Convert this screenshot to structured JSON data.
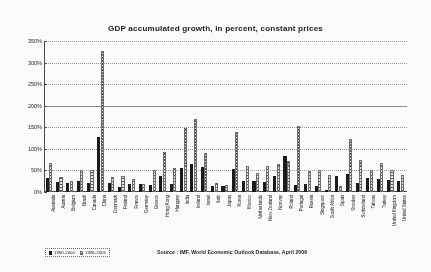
{
  "chart_data": {
    "type": "bar",
    "title": "GDP accumulated growth, in percent, constant prices",
    "xlabel": "",
    "ylabel": "",
    "ylim": [
      0,
      350
    ],
    "ytick_labels": [
      "350%",
      "300%",
      "250%",
      "200%",
      "150%",
      "100%",
      "50%",
      "0%"
    ],
    "ytick_values": [
      350,
      300,
      250,
      200,
      150,
      100,
      50,
      0
    ],
    "grid": true,
    "legend_position": "bottom-left",
    "categories": [
      "Australia",
      "Austria",
      "Belgium",
      "Brazil",
      "Canada",
      "China",
      "Denmark",
      "Finland",
      "France",
      "Germany",
      "Greece",
      "Hong Kong",
      "Hungary",
      "India",
      "Ireland",
      "Israel",
      "Italy",
      "Japan",
      "Korea",
      "Mexico",
      "Netherlands",
      "New Zealand",
      "Norway",
      "Poland",
      "Portugal",
      "Russia",
      "Singapore",
      "South Africa",
      "Spain",
      "Sweden",
      "Switzerland",
      "Taiwan",
      "Turkey",
      "United Kingdom",
      "United States"
    ],
    "series": [
      {
        "name": "1990-2000",
        "values": [
          33,
          24,
          22,
          25,
          22,
          128,
          22,
          12,
          18,
          18,
          17,
          36,
          18,
          55,
          66,
          57,
          14,
          14,
          54,
          25,
          26,
          23,
          37,
          83,
          17,
          19,
          13,
          5,
          38,
          42,
          20,
          32,
          30,
          28,
          25
        ]
      },
      {
        "name": "1996-2005",
        "values": [
          68,
          34,
          25,
          50,
          52,
          326,
          35,
          36,
          31,
          18,
          50,
          92,
          55,
          148,
          170,
          91,
          22,
          17,
          139,
          61,
          43,
          61,
          66,
          73,
          153,
          49,
          52,
          39,
          13,
          124,
          74,
          51,
          67,
          50,
          40
        ]
      }
    ],
    "source_note": "Source : IMF, World Economic Outlook Database, April 2006"
  }
}
